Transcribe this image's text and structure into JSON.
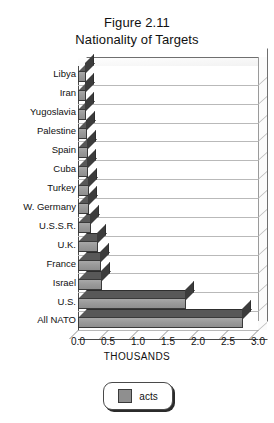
{
  "chart_data": {
    "type": "bar",
    "orientation": "horizontal",
    "title": "Figure 2.11",
    "subtitle": "Nationality of Targets",
    "xlabel": "THOUSANDS",
    "ylabel": "",
    "xlim": [
      0.0,
      3.0
    ],
    "xticks": [
      "0.0",
      "0.5",
      "1.0",
      "1.5",
      "2.0",
      "2.5",
      "3.0"
    ],
    "xtick_values": [
      0.0,
      0.5,
      1.0,
      1.5,
      2.0,
      2.5,
      3.0
    ],
    "grid": true,
    "legend": [
      "acts"
    ],
    "legend_position": "bottom-center",
    "style": "3d-horizontal-bar",
    "bar_color": "#9c9c9c",
    "categories": [
      "Libya",
      "Iran",
      "Yugoslavia",
      "Palestine",
      "Spain",
      "Cuba",
      "Turkey",
      "W. Germany",
      "U.S.S.R.",
      "U.K.",
      "France",
      "Israel",
      "U.S.",
      "All NATO"
    ],
    "series": [
      {
        "name": "acts",
        "values": [
          0.13,
          0.14,
          0.14,
          0.15,
          0.16,
          0.17,
          0.18,
          0.19,
          0.21,
          0.33,
          0.38,
          0.4,
          1.8,
          2.75
        ]
      }
    ]
  },
  "legend": {
    "label": "acts",
    "swatch_color": "#8f8f8f"
  }
}
